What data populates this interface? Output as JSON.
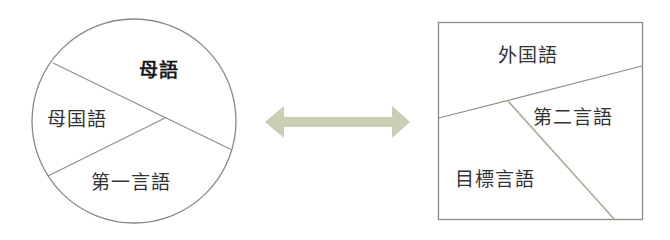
{
  "left_diagram": {
    "shape": "circle",
    "labels": {
      "top": "母語",
      "left": "母国語",
      "bottom": "第一言語"
    }
  },
  "arrow": {
    "type": "bidirectional",
    "color": "#c8cfb3"
  },
  "right_diagram": {
    "shape": "square",
    "labels": {
      "top": "外国語",
      "right": "第二言語",
      "bottom_left": "目標言語"
    }
  },
  "colors": {
    "outline": "#8a8a80",
    "divider": "#9a9a8a",
    "text": "#333333"
  }
}
